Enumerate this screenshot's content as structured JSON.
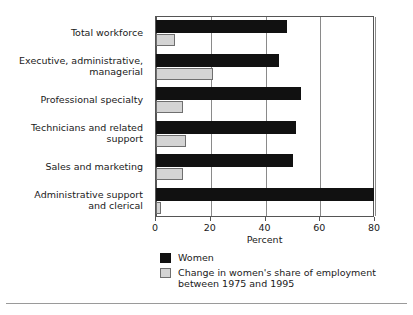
{
  "chart_data": {
    "type": "bar",
    "orientation": "horizontal",
    "title": "",
    "xlabel": "Percent",
    "ylabel": "",
    "xlim": [
      0,
      80
    ],
    "xticks": [
      0,
      20,
      40,
      60,
      80
    ],
    "xtick_labels": [
      "0",
      "20",
      "40",
      "60",
      "80"
    ],
    "grid": true,
    "grid_axis": "x",
    "legend_position": "below-axis-left",
    "categories": [
      "Total workforce",
      "Executive, administrative,\nmanagerial",
      "Professional specialty",
      "Technicians and related\nsupport",
      "Sales and marketing",
      "Administrative support\nand clerical"
    ],
    "series": [
      {
        "name": "Women",
        "color": "#111111",
        "values": [
          48,
          45,
          53,
          51,
          50,
          79.5
        ]
      },
      {
        "name": "Change in women's share of employment\nbetween 1975 and 1995",
        "color": "#d4d4d4",
        "values": [
          7,
          21,
          10,
          11,
          10,
          2
        ]
      }
    ]
  },
  "axis": {
    "x_title": "Percent"
  },
  "legend": {
    "items": [
      {
        "label": "Women",
        "swatch": "black-square-swatch"
      },
      {
        "label": "Change in women's share of employment\nbetween 1975 and 1995",
        "swatch": "gray-square-swatch"
      }
    ]
  }
}
